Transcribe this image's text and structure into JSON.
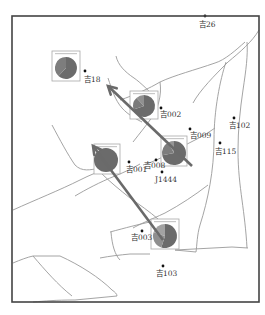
{
  "map": {
    "frame": {
      "x": 12,
      "y": 16,
      "width": 247,
      "height": 286,
      "color": "#444444"
    },
    "colors": {
      "river": "#9a9a9a",
      "arrow": "#6a6a6a",
      "pie_primary": "#6b6b6b",
      "pie_secondary": "#8a8a8a",
      "pie_accent": "#a3a3a3",
      "well_dot": "#111111"
    },
    "wells": [
      {
        "id": "ji26",
        "label": "吉26",
        "x": 205,
        "y": 16,
        "lx": 199,
        "ly": 27
      },
      {
        "id": "ji18",
        "label": "吉18",
        "x": 85,
        "y": 71,
        "lx": 84,
        "ly": 82
      },
      {
        "id": "ji002",
        "label": "吉002",
        "x": 161,
        "y": 108,
        "lx": 160,
        "ly": 117
      },
      {
        "id": "ji009",
        "label": "吉009",
        "x": 190,
        "y": 129,
        "lx": 190,
        "ly": 138
      },
      {
        "id": "ji102",
        "label": "吉102",
        "x": 234,
        "y": 118,
        "lx": 229,
        "ly": 128
      },
      {
        "id": "ji115",
        "label": "吉115",
        "x": 220,
        "y": 143,
        "lx": 215,
        "ly": 154
      },
      {
        "id": "ji001",
        "label": "吉001",
        "x": 129,
        "y": 162,
        "lx": 126,
        "ly": 172
      },
      {
        "id": "ji008",
        "label": "吉008",
        "x": 156,
        "y": 160,
        "lx": 144,
        "ly": 168
      },
      {
        "id": "j1444",
        "label": "J1444",
        "x": 162,
        "y": 172,
        "lx": 155,
        "ly": 182
      },
      {
        "id": "ji003",
        "label": "吉003",
        "x": 142,
        "y": 231,
        "lx": 131,
        "ly": 240
      },
      {
        "id": "ji103",
        "label": "吉103",
        "x": 163,
        "y": 266,
        "lx": 156,
        "ly": 276
      }
    ],
    "pies": [
      {
        "id": "pie-ji18",
        "box": {
          "x": 52,
          "y": 51,
          "w": 28,
          "h": 30
        },
        "cx": 66,
        "cy": 68,
        "r": 11,
        "slices": [
          {
            "value": 62,
            "color": "#6b6b6b"
          },
          {
            "value": 38,
            "color": "#7d7d7d"
          }
        ]
      },
      {
        "id": "pie-ji002",
        "box": {
          "x": 130,
          "y": 91,
          "w": 28,
          "h": 28
        },
        "cx": 144,
        "cy": 106,
        "r": 11,
        "slices": [
          {
            "value": 70,
            "color": "#6b6b6b"
          },
          {
            "value": 18,
            "color": "#7a7a7a"
          },
          {
            "value": 12,
            "color": "#909090"
          }
        ]
      },
      {
        "id": "pie-ji008",
        "box": {
          "x": 161,
          "y": 136,
          "w": 26,
          "h": 30
        },
        "cx": 174,
        "cy": 153,
        "r": 12,
        "slices": [
          {
            "value": 72,
            "color": "#6b6b6b"
          },
          {
            "value": 20,
            "color": "#7d7d7d"
          },
          {
            "value": 8,
            "color": "#959595"
          }
        ]
      },
      {
        "id": "pie-ji001",
        "box": {
          "x": 94,
          "y": 144,
          "w": 26,
          "h": 30
        },
        "cx": 106,
        "cy": 160,
        "r": 12,
        "slices": [
          {
            "value": 100,
            "color": "#6b6b6b"
          }
        ]
      },
      {
        "id": "pie-ji003",
        "box": {
          "x": 151,
          "y": 219,
          "w": 28,
          "h": 30
        },
        "cx": 165,
        "cy": 236,
        "r": 12,
        "slices": [
          {
            "value": 55,
            "color": "#6b6b6b"
          },
          {
            "value": 25,
            "color": "#8f8f8f"
          },
          {
            "value": 20,
            "color": "#a3a3a3"
          }
        ]
      }
    ],
    "arrows": [
      {
        "id": "arrow-upper",
        "from": [
          192,
          166
        ],
        "to": [
          108,
          86
        ]
      },
      {
        "id": "arrow-lower",
        "from": [
          163,
          240
        ],
        "to": [
          93,
          146
        ]
      }
    ],
    "rivers": [
      "M 193 103 C 200 90 215 75 228 62 C 240 52 252 42 259 30",
      "M 120 100 C 135 95 150 88 160 82 C 175 75 195 70 215 63 C 225 60 236 50 245 42",
      "M 226 62 C 220 80 214 110 214 140 C 214 170 208 200 200 225 C 197 235 197 245 196 252",
      "M 247 42 C 248 55 246 70 243 90 C 240 110 238 130 238 150 C 238 170 240 185 242 200 C 244 215 246 230 247 248",
      "M 248 248 L 232 247 L 175 250",
      "M 196 252 L 175 250",
      "M 108 78 C 112 90 115 100 122 108 C 128 115 138 120 142 122",
      "M 116 56 C 118 65 125 72 134 78 C 140 82 150 92 157 99",
      "M 160 82 C 162 95 158 110 150 120 C 145 127 140 133 133 142",
      "M 52 125 C 60 140 68 155 75 165 C 82 172 90 170 100 168",
      "M 13 210 C 35 200 60 190 80 180 C 90 175 97 172 105 170",
      "M 75 196 C 85 190 100 182 115 176 C 125 172 133 168 140 164",
      "M 100 172 C 110 182 120 190 130 198 C 140 205 150 212 158 219",
      "M 143 165 C 160 160 175 150 195 140 C 205 135 212 130 215 128",
      "M 208 185 C 195 195 180 205 165 213 C 150 220 140 224 133 228",
      "M 110 232 C 125 228 140 224 150 222",
      "M 111 232 C 112 245 115 255 120 260",
      "M 13 263 C 20 260 28 257 33 256 L 60 256 C 80 265 100 278 112 290",
      "M 33 256 C 45 270 58 285 72 296",
      "M 112 290 C 115 292 117 294 117 296 L 75 300 C 55 300 45 301 33 302",
      "M 100 258 C 110 256 120 255 130 254 L 150 254"
    ],
    "legend": []
  }
}
